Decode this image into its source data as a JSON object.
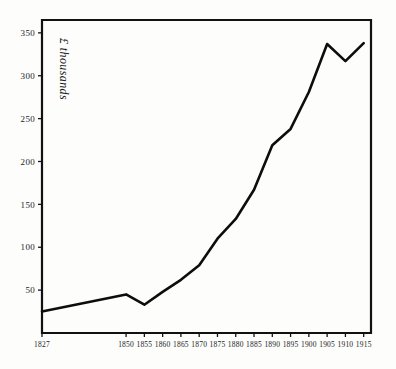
{
  "chart_data": {
    "type": "line",
    "title": "",
    "subtitle": "",
    "xlabel": "",
    "ylabel": "£ thousands",
    "x": [
      1827,
      1850,
      1855,
      1860,
      1865,
      1870,
      1875,
      1880,
      1885,
      1890,
      1895,
      1900,
      1905,
      1910,
      1915
    ],
    "values": [
      25,
      45,
      33,
      48,
      62,
      79,
      110,
      133,
      167,
      219,
      238,
      281,
      337,
      317,
      338
    ],
    "xtick_labels": [
      "1827",
      "1850",
      "1855",
      "1860",
      "1865",
      "1870",
      "1875",
      "1880",
      "1885",
      "1890",
      "1895",
      "1900",
      "1905",
      "1910",
      "1915"
    ],
    "ytick_labels": [
      "50",
      "100",
      "150",
      "200",
      "250",
      "300",
      "350"
    ],
    "ytick_values": [
      50,
      100,
      150,
      200,
      250,
      300,
      350
    ],
    "ylim": [
      0,
      365
    ],
    "xlim": [
      1827,
      1917
    ],
    "grid": false,
    "legend": false,
    "legend_position": "none",
    "series": [
      {
        "name": "£ thousands",
        "values": [
          25,
          45,
          33,
          48,
          62,
          79,
          110,
          133,
          167,
          219,
          238,
          281,
          337,
          317,
          338
        ],
        "color": "#0d0d0d"
      }
    ],
    "annotations": []
  },
  "colors": {
    "line": "#0d0d0d",
    "axis": "#111111",
    "background": "#fdfdfc",
    "text": "#1c1c1c"
  },
  "axis": {
    "y_title": "£ thousands"
  }
}
